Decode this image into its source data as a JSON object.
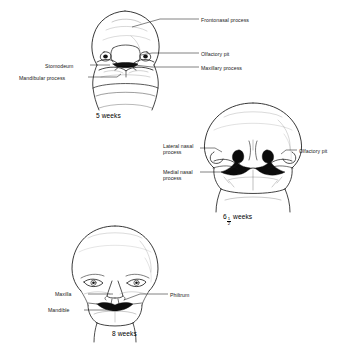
{
  "figure": {
    "background_color": "#ffffff",
    "line_color": "#000000",
    "panels": [
      {
        "id": "panel-5-weeks",
        "caption": "5 weeks",
        "stage_weeks": 5,
        "labels": [
          {
            "id": "frontonasal-process",
            "text": "Frontonasal process",
            "side": "right"
          },
          {
            "id": "olfactory-pit",
            "text": "Olfactory pit",
            "side": "right"
          },
          {
            "id": "maxillary-process",
            "text": "Maxillary process",
            "side": "right"
          },
          {
            "id": "stomodeum",
            "text": "Stomodeum",
            "side": "left"
          },
          {
            "id": "mandibular-process",
            "text": "Mandibular process",
            "side": "left"
          }
        ]
      },
      {
        "id": "panel-6-5-weeks",
        "caption_prefix": "6",
        "caption_numerator": "1",
        "caption_denominator": "2",
        "caption_suffix": "weeks",
        "caption_plain": "6 1/2 weeks",
        "stage_weeks": 6.5,
        "labels": [
          {
            "id": "lateral-nasal-process",
            "text": "Lateral nasal process",
            "side": "left"
          },
          {
            "id": "medial-nasal-process",
            "text": "Medial nasal process",
            "side": "left"
          },
          {
            "id": "olfactory-pit",
            "text": "Olfactory pit",
            "side": "right"
          }
        ]
      },
      {
        "id": "panel-8-weeks",
        "caption": "8 weeks",
        "stage_weeks": 8,
        "labels": [
          {
            "id": "maxilla",
            "text": "Maxilla",
            "side": "left"
          },
          {
            "id": "mandible",
            "text": "Mandible",
            "side": "left"
          },
          {
            "id": "philtrum",
            "text": "Philtrum",
            "side": "right"
          }
        ]
      }
    ]
  }
}
